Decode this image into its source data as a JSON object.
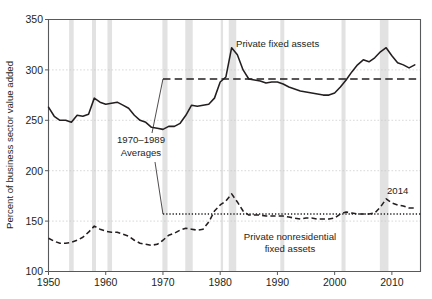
{
  "chart_data": {
    "type": "line",
    "title": "",
    "xlabel": "",
    "ylabel": "Percent of business sector value added",
    "xlim": [
      1950,
      2015
    ],
    "ylim": [
      100,
      350
    ],
    "grid": true,
    "legend_position": "inline-annotations",
    "y_ticks": [
      100,
      150,
      200,
      250,
      300,
      350
    ],
    "y_tick_labels": [
      "100",
      "150",
      "200",
      "250",
      "300",
      "350"
    ],
    "x_ticks": [
      1950,
      1960,
      1970,
      1980,
      1990,
      2000,
      2010
    ],
    "x_tick_labels": [
      "1950",
      "1960",
      "1970",
      "1980",
      "1990",
      "2000",
      "2010"
    ],
    "series": [
      {
        "name": "Private fixed assets",
        "style": "solid",
        "x": [
          1950,
          1951,
          1952,
          1953,
          1954,
          1955,
          1956,
          1957,
          1958,
          1959,
          1960,
          1961,
          1962,
          1963,
          1964,
          1965,
          1966,
          1967,
          1968,
          1969,
          1970,
          1971,
          1972,
          1973,
          1974,
          1975,
          1976,
          1977,
          1978,
          1979,
          1980,
          1981,
          1982,
          1983,
          1984,
          1985,
          1986,
          1987,
          1988,
          1989,
          1990,
          1991,
          1992,
          1993,
          1994,
          1995,
          1996,
          1997,
          1998,
          1999,
          2000,
          2001,
          2002,
          2003,
          2004,
          2005,
          2006,
          2007,
          2008,
          2009,
          2010,
          2011,
          2012,
          2013,
          2014
        ],
        "y": [
          263,
          254,
          250,
          250,
          248,
          255,
          254,
          256,
          272,
          268,
          266,
          267,
          268,
          265,
          262,
          255,
          250,
          248,
          243,
          242,
          241,
          244,
          244,
          247,
          255,
          265,
          264,
          265,
          266,
          272,
          288,
          293,
          322,
          315,
          300,
          291,
          290,
          289,
          287,
          288,
          288,
          286,
          283,
          281,
          279,
          278,
          277,
          276,
          275,
          275,
          277,
          283,
          290,
          298,
          305,
          310,
          308,
          312,
          318,
          322,
          314,
          307,
          305,
          302,
          305
        ]
      },
      {
        "name": "Private nonresidential fixed assets",
        "style": "dashed",
        "x": [
          1950,
          1951,
          1952,
          1953,
          1954,
          1955,
          1956,
          1957,
          1958,
          1959,
          1960,
          1961,
          1962,
          1963,
          1964,
          1965,
          1966,
          1967,
          1968,
          1969,
          1970,
          1971,
          1972,
          1973,
          1974,
          1975,
          1976,
          1977,
          1978,
          1979,
          1980,
          1981,
          1982,
          1983,
          1984,
          1985,
          1986,
          1987,
          1988,
          1989,
          1990,
          1991,
          1992,
          1993,
          1994,
          1995,
          1996,
          1997,
          1998,
          1999,
          2000,
          2001,
          2002,
          2003,
          2004,
          2005,
          2006,
          2007,
          2008,
          2009,
          2010,
          2011,
          2012,
          2013,
          2014
        ],
        "y": [
          133,
          130,
          128,
          128,
          129,
          131,
          134,
          139,
          145,
          142,
          140,
          139,
          139,
          137,
          135,
          131,
          128,
          127,
          126,
          127,
          131,
          136,
          138,
          141,
          143,
          142,
          141,
          142,
          149,
          160,
          166,
          170,
          177,
          169,
          160,
          156,
          156,
          156,
          155,
          155,
          155,
          155,
          154,
          153,
          152,
          153,
          153,
          152,
          152,
          152,
          153,
          157,
          159,
          158,
          157,
          157,
          157,
          158,
          164,
          172,
          168,
          166,
          165,
          163,
          163
        ]
      }
    ],
    "reference_lines": [
      {
        "name": "private-fixed-assets-avg",
        "style": "dashed",
        "value": 291,
        "x_start": 1970,
        "x_end": 2015
      },
      {
        "name": "private-nonresidential-avg",
        "style": "dotted",
        "value": 157,
        "x_start": 1970,
        "x_end": 2015
      }
    ],
    "recession_bands": [
      {
        "start": 1953.6,
        "end": 1954.4
      },
      {
        "start": 1957.6,
        "end": 1958.3
      },
      {
        "start": 1960.3,
        "end": 1961.1
      },
      {
        "start": 1969.9,
        "end": 1970.8
      },
      {
        "start": 1973.9,
        "end": 1975.2
      },
      {
        "start": 1980.1,
        "end": 1980.5
      },
      {
        "start": 1981.5,
        "end": 1982.8
      },
      {
        "start": 1990.5,
        "end": 1991.2
      },
      {
        "start": 2001.2,
        "end": 2001.9
      },
      {
        "start": 2007.9,
        "end": 2009.4
      }
    ]
  },
  "annotations": {
    "averages_label_line1": "1970–1989",
    "averages_label_line2": "Averages",
    "private_fixed_assets_label": "Private fixed assets",
    "private_nonresidential_label_line1": "Private nonresidential",
    "private_nonresidential_label_line2": "fixed assets",
    "year_2014_label": "2014"
  },
  "colors": {
    "line": "#231f20",
    "axis": "#58595b",
    "grid": "#c9c9c9",
    "recession_band": "#dddddd",
    "background": "#ffffff"
  }
}
